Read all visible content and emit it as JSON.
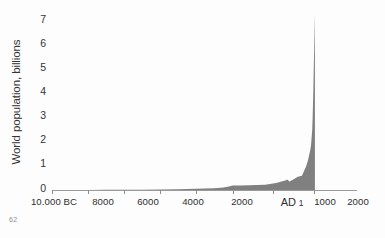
{
  "figure": {
    "footnote": "62",
    "fill_color": "#808080",
    "axis_color": "#9a9a9a",
    "text_color": "#333333",
    "background": "#ffffff"
  },
  "chart_data": {
    "type": "area",
    "title": "",
    "xlabel": "",
    "ylabel": "World population, billions",
    "ylim": [
      0,
      7.6
    ],
    "xlim": [
      -10000,
      2015
    ],
    "grid": false,
    "legend": null,
    "ytick_labels": [
      "0",
      "1",
      "2",
      "3",
      "4",
      "5",
      "6",
      "7"
    ],
    "ytick_values": [
      0,
      1,
      2,
      3,
      4,
      5,
      6,
      7
    ],
    "xtick_labels": [
      "10.000 BC",
      "8000",
      "6000",
      "4000",
      "2000",
      "AD 1",
      "1000",
      "2000"
    ],
    "xtick_values": [
      -10000,
      -8000,
      -6000,
      -4000,
      -2000,
      1,
      1000,
      2000
    ],
    "xtick_positions_pct": [
      0,
      11.8,
      23.6,
      35.4,
      47.2,
      59.2,
      72.5,
      86.0
    ],
    "x": [
      -10000,
      -9000,
      -8000,
      -7000,
      -6000,
      -5000,
      -4000,
      -3000,
      -2000,
      -1500,
      -1000,
      -500,
      -200,
      1,
      200,
      400,
      600,
      800,
      1000,
      1100,
      1200,
      1300,
      1340,
      1400,
      1500,
      1600,
      1700,
      1750,
      1800,
      1850,
      1900,
      1920,
      1950,
      1960,
      1970,
      1980,
      1990,
      2000,
      2010,
      2015
    ],
    "y": [
      0.004,
      0.005,
      0.005,
      0.006,
      0.007,
      0.01,
      0.02,
      0.03,
      0.05,
      0.06,
      0.07,
      0.1,
      0.15,
      0.19,
      0.19,
      0.2,
      0.21,
      0.22,
      0.27,
      0.3,
      0.36,
      0.4,
      0.44,
      0.35,
      0.45,
      0.55,
      0.6,
      0.79,
      0.98,
      1.26,
      1.65,
      1.86,
      2.53,
      3.03,
      3.7,
      4.44,
      5.32,
      6.14,
      6.96,
      7.35
    ],
    "series_name": "World population",
    "units": "billions",
    "peak_value": 7.35,
    "annotations": []
  }
}
